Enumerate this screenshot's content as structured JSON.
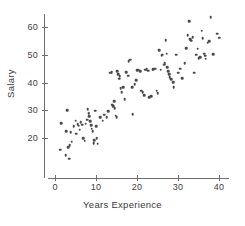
{
  "chart_data": {
    "type": "scatter",
    "title": "",
    "xlabel": "Years Experience",
    "ylabel": "Salary",
    "xlim": [
      -1,
      42
    ],
    "ylim": [
      10,
      66
    ],
    "xticks": [
      0,
      10,
      20,
      30,
      40
    ],
    "yticks": [
      20,
      30,
      40,
      50,
      60
    ],
    "xtick_labels": [
      "0",
      "10",
      "20",
      "30",
      "40"
    ],
    "ytick_labels": [
      "20",
      "30",
      "40",
      "50",
      "60"
    ],
    "grid": false,
    "legend": null,
    "marker": {
      "shape": "circle",
      "color": "#4a4a4a",
      "size": 2.6
    },
    "n_points": 120,
    "series": [
      {
        "name": "employees",
        "points": [
          [
            1.2,
            15.8
          ],
          [
            1.5,
            25.3
          ],
          [
            2.6,
            13.9
          ],
          [
            2.8,
            22.4
          ],
          [
            3.0,
            30.1
          ],
          [
            3.2,
            16.6
          ],
          [
            3.4,
            12.6
          ],
          [
            3.6,
            17.4
          ],
          [
            3.8,
            22.0
          ],
          [
            4.1,
            18.7
          ],
          [
            4.6,
            24.2
          ],
          [
            5.0,
            26.2
          ],
          [
            5.2,
            21.6
          ],
          [
            5.5,
            25.0
          ],
          [
            5.8,
            24.4
          ],
          [
            6.0,
            23.0
          ],
          [
            6.3,
            25.6
          ],
          [
            6.6,
            24.8
          ],
          [
            6.9,
            20.0
          ],
          [
            7.2,
            19.0
          ],
          [
            7.5,
            25.2
          ],
          [
            7.8,
            26.6
          ],
          [
            8.0,
            30.4
          ],
          [
            8.2,
            29.0
          ],
          [
            8.4,
            27.8
          ],
          [
            8.6,
            26.0
          ],
          [
            8.8,
            24.6
          ],
          [
            9.0,
            23.4
          ],
          [
            9.2,
            22.4
          ],
          [
            9.4,
            18.2
          ],
          [
            9.6,
            19.2
          ],
          [
            9.8,
            29.8
          ],
          [
            10.0,
            24.2
          ],
          [
            10.2,
            20.0
          ],
          [
            10.4,
            18.0
          ],
          [
            11.0,
            27.6
          ],
          [
            11.6,
            26.2
          ],
          [
            12.0,
            28.4
          ],
          [
            12.6,
            27.4
          ],
          [
            13.0,
            29.6
          ],
          [
            13.4,
            43.6
          ],
          [
            13.8,
            43.8
          ],
          [
            14.0,
            32.0
          ],
          [
            14.2,
            31.4
          ],
          [
            14.4,
            33.2
          ],
          [
            14.6,
            30.8
          ],
          [
            14.8,
            28.0
          ],
          [
            15.0,
            27.4
          ],
          [
            15.2,
            44.0
          ],
          [
            15.4,
            43.0
          ],
          [
            15.6,
            41.4
          ],
          [
            15.8,
            42.2
          ],
          [
            16.0,
            38.0
          ],
          [
            16.3,
            36.6
          ],
          [
            16.6,
            38.4
          ],
          [
            17.0,
            34.0
          ],
          [
            17.4,
            43.8
          ],
          [
            17.8,
            42.4
          ],
          [
            18.0,
            47.6
          ],
          [
            18.4,
            48.2
          ],
          [
            18.8,
            38.2
          ],
          [
            19.0,
            28.6
          ],
          [
            19.4,
            39.4
          ],
          [
            19.8,
            40.8
          ],
          [
            20.0,
            44.4
          ],
          [
            20.4,
            44.6
          ],
          [
            20.8,
            44.0
          ],
          [
            21.0,
            37.0
          ],
          [
            21.4,
            36.4
          ],
          [
            21.8,
            35.4
          ],
          [
            22.0,
            44.6
          ],
          [
            22.4,
            44.8
          ],
          [
            22.8,
            44.2
          ],
          [
            23.0,
            34.6
          ],
          [
            23.4,
            35.0
          ],
          [
            23.8,
            44.6
          ],
          [
            24.0,
            44.8
          ],
          [
            24.4,
            45.0
          ],
          [
            24.8,
            37.0
          ],
          [
            25.0,
            36.2
          ],
          [
            25.4,
            51.6
          ],
          [
            25.8,
            44.6
          ],
          [
            26.0,
            49.6
          ],
          [
            26.2,
            50.0
          ],
          [
            26.6,
            46.4
          ],
          [
            26.8,
            47.0
          ],
          [
            27.0,
            55.2
          ],
          [
            27.2,
            50.4
          ],
          [
            27.4,
            45.6
          ],
          [
            27.6,
            44.0
          ],
          [
            27.8,
            43.0
          ],
          [
            28.0,
            42.0
          ],
          [
            28.4,
            41.2
          ],
          [
            28.8,
            40.2
          ],
          [
            29.0,
            38.4
          ],
          [
            29.6,
            50.0
          ],
          [
            30.0,
            43.6
          ],
          [
            30.6,
            45.0
          ],
          [
            31.0,
            41.6
          ],
          [
            31.6,
            47.0
          ],
          [
            32.0,
            52.4
          ],
          [
            32.4,
            57.0
          ],
          [
            32.8,
            62.0
          ],
          [
            33.0,
            55.6
          ],
          [
            33.2,
            55.0
          ],
          [
            33.6,
            56.4
          ],
          [
            34.0,
            43.6
          ],
          [
            34.4,
            50.0
          ],
          [
            34.8,
            52.2
          ],
          [
            35.0,
            48.8
          ],
          [
            35.4,
            49.2
          ],
          [
            35.8,
            58.6
          ],
          [
            36.0,
            56.0
          ],
          [
            36.4,
            50.4
          ],
          [
            36.6,
            49.6
          ],
          [
            36.8,
            48.6
          ],
          [
            37.2,
            54.4
          ],
          [
            37.6,
            54.8
          ],
          [
            38.0,
            63.6
          ],
          [
            38.6,
            50.2
          ],
          [
            39.6,
            57.6
          ],
          [
            40.0,
            56.2
          ]
        ]
      }
    ]
  }
}
